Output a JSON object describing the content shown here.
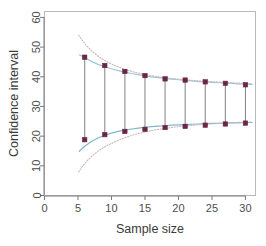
{
  "figure": {
    "type": "r-base-graphics-plot",
    "background_color": "#ffffff",
    "box_color": "#b9b9b9"
  },
  "chart_data": {
    "type": "scatter",
    "title": "",
    "subtitle": "",
    "xlabel": "Sample size",
    "ylabel": "Confidence interval",
    "xlim": [
      0,
      31.5
    ],
    "ylim": [
      0,
      62
    ],
    "xticks": [
      0,
      5,
      10,
      15,
      20,
      25,
      30
    ],
    "yticks": [
      0,
      10,
      20,
      30,
      40,
      50,
      60
    ],
    "grid": false,
    "legend": null,
    "legend_position": "none",
    "x": [
      6,
      9,
      12,
      15,
      18,
      21,
      24,
      27,
      30
    ],
    "series": [
      {
        "name": "Upper confidence limit (observed)",
        "marker": "filled-square",
        "color": "#6b2545",
        "values": [
          46.6,
          43.8,
          41.8,
          40.4,
          39.3,
          38.9,
          38.3,
          37.8,
          37.3
        ]
      },
      {
        "name": "Lower confidence limit (observed)",
        "marker": "filled-square",
        "color": "#6b2545",
        "values": [
          18.8,
          20.5,
          21.6,
          22.3,
          22.9,
          23.3,
          23.7,
          24.1,
          24.4
        ]
      }
    ],
    "errorbars": {
      "name": "Confidence interval bars",
      "color": "#8c8c8c",
      "x": [
        6,
        9,
        12,
        15,
        18,
        21,
        24,
        27,
        30
      ],
      "lower": [
        18.8,
        20.5,
        21.6,
        22.3,
        22.9,
        23.3,
        23.7,
        24.1,
        24.4
      ],
      "upper": [
        46.6,
        43.8,
        41.8,
        40.4,
        39.3,
        38.9,
        38.3,
        37.8,
        37.3
      ]
    },
    "curves": [
      {
        "name": "Upper envelope (fitted)",
        "style": "solid",
        "color": "#9dc6d8",
        "x": [
          5.2,
          6,
          7,
          8,
          9,
          10,
          11,
          12,
          13,
          14,
          15,
          16,
          17,
          18,
          19,
          20,
          21,
          22,
          23,
          24,
          25,
          26,
          27,
          28,
          29,
          30,
          31
        ],
        "y": [
          47.4,
          46.4,
          45.2,
          44.2,
          43.4,
          42.7,
          42.1,
          41.6,
          41.1,
          40.7,
          40.3,
          40.0,
          39.7,
          39.4,
          39.2,
          39.0,
          38.8,
          38.6,
          38.4,
          38.3,
          38.1,
          38.0,
          37.9,
          37.8,
          37.6,
          37.5,
          37.4
        ]
      },
      {
        "name": "Lower envelope (fitted)",
        "style": "solid",
        "color": "#7fb8cc",
        "x": [
          5.2,
          6,
          7,
          8,
          9,
          10,
          11,
          12,
          13,
          14,
          15,
          16,
          17,
          18,
          19,
          20,
          21,
          22,
          23,
          24,
          25,
          26,
          27,
          28,
          29,
          30,
          31
        ],
        "y": [
          14.9,
          16.6,
          18.2,
          19.4,
          20.3,
          21.0,
          21.6,
          22.0,
          22.4,
          22.7,
          23.0,
          23.2,
          23.4,
          23.5,
          23.7,
          23.8,
          23.9,
          24.0,
          24.1,
          24.2,
          24.3,
          24.3,
          24.4,
          24.5,
          24.5,
          24.6,
          24.6
        ]
      },
      {
        "name": "Upper outer band (dotted)",
        "style": "dotted",
        "color": "#cbb6bd",
        "x": [
          5.1,
          5.6,
          6.3,
          7.2,
          8.2,
          9.4,
          10.6,
          12,
          13.5,
          15,
          16.5,
          18,
          19.5,
          21,
          22.5,
          24,
          25.5,
          27,
          28.5,
          30,
          31
        ],
        "y": [
          54.0,
          52.4,
          50.4,
          48.4,
          46.6,
          45.0,
          43.7,
          42.5,
          41.5,
          40.8,
          40.2,
          39.7,
          39.3,
          39.0,
          38.7,
          38.5,
          38.3,
          38.1,
          37.9,
          37.8,
          37.7
        ]
      },
      {
        "name": "Lower outer band (dotted)",
        "style": "dotted",
        "color": "#cbb6bd",
        "x": [
          5.1,
          5.6,
          6.3,
          7.2,
          8.2,
          9.4,
          10.6,
          12,
          13.5,
          15,
          16.5,
          18,
          19.5,
          21,
          22.5,
          24,
          25.5,
          27,
          28.5,
          30,
          31
        ],
        "y": [
          7.9,
          9.6,
          11.6,
          13.5,
          15.3,
          16.9,
          18.2,
          19.5,
          20.6,
          21.4,
          22.1,
          22.6,
          23.1,
          23.4,
          23.7,
          24.0,
          24.2,
          24.4,
          24.6,
          24.7,
          24.8
        ]
      }
    ]
  }
}
